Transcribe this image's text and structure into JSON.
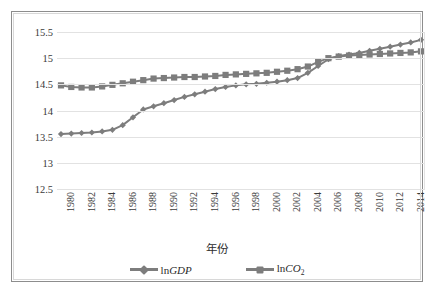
{
  "chart_data": {
    "type": "line",
    "title": "",
    "xlabel": "年份",
    "ylabel": "",
    "ylim": [
      12.5,
      15.5
    ],
    "ytick_step": 0.5,
    "yticks": [
      "12.5",
      "13",
      "13.5",
      "14",
      "14.5",
      "15",
      "15.5"
    ],
    "grid": true,
    "legend_position": "bottom",
    "x": [
      1980,
      1981,
      1982,
      1983,
      1984,
      1985,
      1986,
      1987,
      1988,
      1989,
      1990,
      1991,
      1992,
      1993,
      1994,
      1995,
      1996,
      1997,
      1998,
      1999,
      2000,
      2001,
      2002,
      2003,
      2004,
      2005,
      2006,
      2007,
      2008,
      2009,
      2010,
      2011,
      2012,
      2013,
      2014,
      2015
    ],
    "xtick_labels": [
      "1980",
      "1982",
      "1984",
      "1986",
      "1988",
      "1990",
      "1992",
      "1994",
      "1996",
      "1998",
      "2000",
      "2002",
      "2004",
      "2006",
      "2008",
      "2010",
      "2012",
      "2014"
    ],
    "series": [
      {
        "name": "lnGDP",
        "marker": "diamond",
        "color": "#7d7d7d",
        "values": [
          13.55,
          13.56,
          13.57,
          13.58,
          13.6,
          13.63,
          13.72,
          13.87,
          14.02,
          14.08,
          14.14,
          14.2,
          14.26,
          14.31,
          14.36,
          14.41,
          14.45,
          14.48,
          14.5,
          14.51,
          14.53,
          14.55,
          14.58,
          14.62,
          14.72,
          14.85,
          14.98,
          15.04,
          15.07,
          15.1,
          15.14,
          15.18,
          15.22,
          15.26,
          15.3,
          15.35
        ]
      },
      {
        "name": "lnCO2",
        "marker": "square",
        "color": "#7d7d7d",
        "values": [
          14.48,
          14.45,
          14.44,
          14.44,
          14.46,
          14.49,
          14.52,
          14.55,
          14.58,
          14.61,
          14.62,
          14.63,
          14.64,
          14.64,
          14.65,
          14.66,
          14.68,
          14.69,
          14.7,
          14.71,
          14.72,
          14.74,
          14.76,
          14.79,
          14.84,
          14.93,
          15.0,
          15.03,
          15.05,
          15.06,
          15.07,
          15.08,
          15.09,
          15.1,
          15.11,
          15.13
        ]
      }
    ]
  },
  "legend": {
    "items": [
      {
        "label_prefix": "ln",
        "label_italic": "GDP",
        "label_sub": ""
      },
      {
        "label_prefix": "ln",
        "label_italic": "CO",
        "label_sub": "2"
      }
    ]
  }
}
